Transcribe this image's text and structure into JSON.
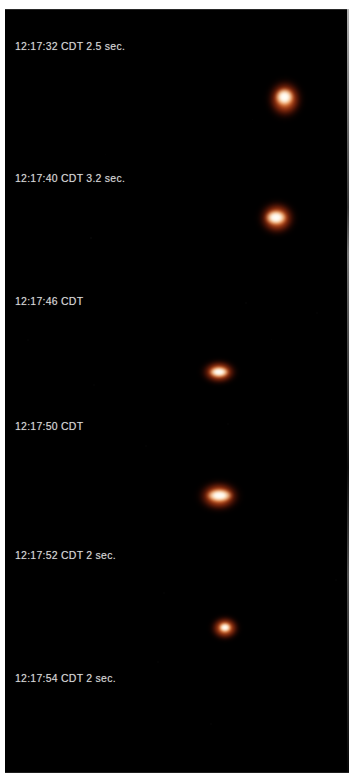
{
  "image": {
    "kind": "night-sky-photo-sequence",
    "background_color": "#000000",
    "border_color": "#ffffff",
    "caption_color": "#d9d9d9",
    "object_core_color": "#ffffff",
    "object_glow_color": "#ff7a32",
    "object_halo_color": "#8a1a06"
  },
  "captions": [
    {
      "text": "12:17:32 CDT  2.5 sec.",
      "time": "12:17:32",
      "zone": "CDT",
      "exposure": "2.5 sec."
    },
    {
      "text": "12:17:40 CDT  3.2 sec.",
      "time": "12:17:40",
      "zone": "CDT",
      "exposure": "3.2 sec."
    },
    {
      "text": "12:17:46 CDT",
      "time": "12:17:46",
      "zone": "CDT",
      "exposure": ""
    },
    {
      "text": "12:17:50 CDT",
      "time": "12:17:50",
      "zone": "CDT",
      "exposure": ""
    },
    {
      "text": "12:17:52 CDT  2 sec.",
      "time": "12:17:52",
      "zone": "CDT",
      "exposure": "2 sec."
    },
    {
      "text": "12:17:54 CDT  2 sec.",
      "time": "12:17:54",
      "zone": "CDT",
      "exposure": "2 sec."
    }
  ],
  "objects": [
    {
      "label": "light-object-1",
      "brightness": "bright",
      "shape": "round"
    },
    {
      "label": "light-object-2",
      "brightness": "bright",
      "shape": "round-wide"
    },
    {
      "label": "light-object-3",
      "brightness": "moderate",
      "shape": "flattened"
    },
    {
      "label": "light-object-4",
      "brightness": "bright",
      "shape": "elongated"
    },
    {
      "label": "light-object-5",
      "brightness": "dim",
      "shape": "small-round"
    }
  ]
}
